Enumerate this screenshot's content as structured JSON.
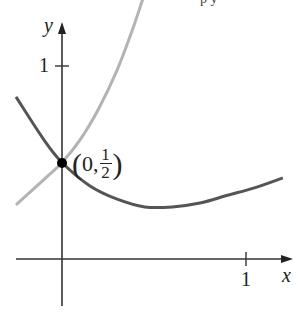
{
  "chart_data": {
    "type": "line",
    "title": "",
    "xlabel": "x",
    "ylabel": "y",
    "x_ticks": [
      {
        "value": 1,
        "label": "1"
      }
    ],
    "y_ticks": [
      {
        "value": 1,
        "label": "1"
      }
    ],
    "xlim": [
      -0.25,
      1.2
    ],
    "ylim": [
      -0.3,
      1.35
    ],
    "grid": false,
    "legend": null,
    "series": [
      {
        "name": "decreasing-curve",
        "color": "#555555",
        "points": [
          [
            -0.25,
            0.84
          ],
          [
            -0.1,
            0.62
          ],
          [
            0,
            0.5
          ],
          [
            0.15,
            0.38
          ],
          [
            0.3,
            0.31
          ],
          [
            0.45,
            0.27
          ],
          [
            0.6,
            0.27
          ],
          [
            0.75,
            0.29
          ],
          [
            0.9,
            0.33
          ],
          [
            1.05,
            0.37
          ],
          [
            1.2,
            0.42
          ]
        ]
      },
      {
        "name": "increasing-curve",
        "color": "#b3b3b3",
        "points": [
          [
            -0.25,
            0.28
          ],
          [
            -0.1,
            0.41
          ],
          [
            0,
            0.5
          ],
          [
            0.1,
            0.62
          ],
          [
            0.2,
            0.78
          ],
          [
            0.3,
            0.98
          ],
          [
            0.38,
            1.18
          ],
          [
            0.44,
            1.35
          ]
        ]
      }
    ],
    "annotations": [
      {
        "type": "point",
        "x": 0,
        "y": 0.5,
        "label": "(0, 1/2)"
      }
    ]
  },
  "labels": {
    "x_axis": "x",
    "y_axis": "y",
    "x_tick_1": "1",
    "y_tick_1": "1",
    "point_open": "(",
    "point_x": "0,",
    "point_num": "1",
    "point_den": "2",
    "point_close": ")",
    "cropped_header": "p  y"
  }
}
